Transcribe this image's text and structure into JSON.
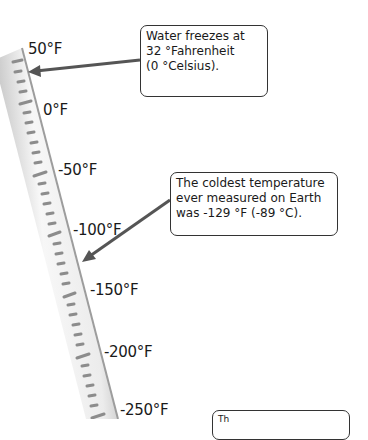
{
  "diagram": {
    "scale_labels": [
      {
        "text": "50°F",
        "x": 28,
        "y": 42
      },
      {
        "text": "0°F",
        "x": 43,
        "y": 103
      },
      {
        "text": "-50°F",
        "x": 58,
        "y": 163
      },
      {
        "text": "-100°F",
        "x": 73,
        "y": 223
      },
      {
        "text": "-150°F",
        "x": 90,
        "y": 283
      },
      {
        "text": "-200°F",
        "x": 104,
        "y": 345
      },
      {
        "text": "-250°F",
        "x": 120,
        "y": 403
      }
    ],
    "callouts": [
      {
        "id": "freezing",
        "lines": [
          "Water freezes at",
          "32 °Fahrenheit",
          "(0 °Celsius)."
        ]
      },
      {
        "id": "coldest",
        "lines": [
          "The coldest temperature",
          "ever measured on Earth",
          "was -129 °F (-89 °C)."
        ]
      },
      {
        "id": "partial-bottom",
        "lines": [
          "Th"
        ]
      }
    ],
    "colors": {
      "tube_light": "#f2f2f2",
      "tube_shadow": "#9a9a9a",
      "tick": "#8c8c8c",
      "arrow": "#555555",
      "callout_border": "#333333",
      "text": "#1a1a1a"
    }
  }
}
